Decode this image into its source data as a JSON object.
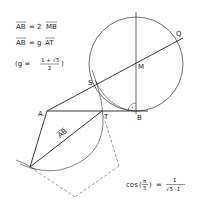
{
  "diagram": {
    "equations": {
      "eq1_lhs": "AB",
      "eq1_rel": "= 2",
      "eq1_rhs": "MB",
      "eq2_lhs": "AB",
      "eq2_rel": "= g",
      "eq2_rhs": "AT",
      "eq3_open": "(g =",
      "eq3_num": "1 + √5",
      "eq3_den": "2",
      "eq3_close": ")",
      "cos_lhs": "cos",
      "cos_arg_num": "π",
      "cos_arg_den": "5",
      "cos_eq": "=",
      "cos_num": "1",
      "cos_den": "√5 -1"
    },
    "points": {
      "A": {
        "label": "A",
        "x": 47,
        "y": 111
      },
      "B": {
        "label": "B",
        "x": 136,
        "y": 111
      },
      "T": {
        "label": "T",
        "x": 102,
        "y": 111
      },
      "S": {
        "label": "S",
        "x": 96,
        "y": 84
      },
      "M": {
        "label": "M",
        "x": 136,
        "y": 64
      },
      "Q": {
        "label": "Q",
        "x": 180,
        "y": 40
      },
      "P": {
        "label": "",
        "x": 30,
        "y": 167
      }
    },
    "segment_label": "AB",
    "colors": {
      "stroke": "#222222",
      "dashed": "#555555",
      "background": "#ffffff"
    }
  }
}
